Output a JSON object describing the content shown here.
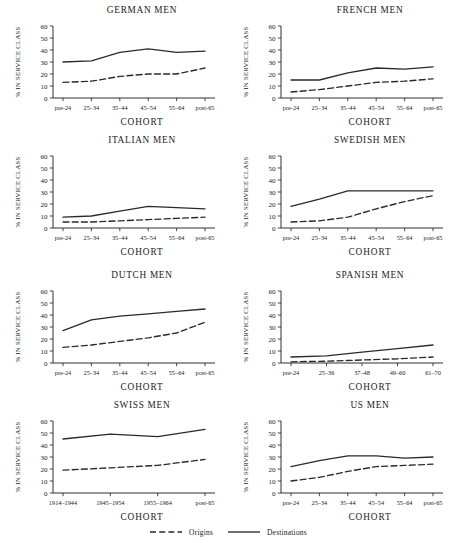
{
  "figure": {
    "ylabel": "% IN SERVICE CLASS",
    "xlabel": "COHORT",
    "yticks": [
      "0",
      "10",
      "20",
      "30",
      "40",
      "50",
      "60"
    ],
    "ylim": [
      0,
      60
    ],
    "legend": {
      "position": "bottom-center",
      "items": [
        {
          "label": "Origins",
          "style": "dashed"
        },
        {
          "label": "Destinations",
          "style": "solid"
        }
      ]
    },
    "line_color": "#2a2a2a"
  },
  "chart_data": [
    {
      "type": "line",
      "title": "GERMAN MEN",
      "xlabel": "COHORT",
      "ylabel": "% IN SERVICE CLASS",
      "ylim": [
        0,
        60
      ],
      "grid": false,
      "categories": [
        "pre-24",
        "25–34",
        "35–44",
        "45–54",
        "55–64",
        "post-65"
      ],
      "series": [
        {
          "name": "Origins",
          "style": "dashed",
          "values": [
            13,
            14,
            18,
            20,
            20,
            25
          ]
        },
        {
          "name": "Destinations",
          "style": "solid",
          "values": [
            30,
            31,
            38,
            41,
            38,
            39
          ]
        }
      ]
    },
    {
      "type": "line",
      "title": "FRENCH MEN",
      "xlabel": "COHORT",
      "ylabel": "% IN SERVICE CLASS",
      "ylim": [
        0,
        60
      ],
      "grid": false,
      "categories": [
        "pre-24",
        "25–34",
        "35–44",
        "45–54",
        "55–64",
        "post-65"
      ],
      "series": [
        {
          "name": "Origins",
          "style": "dashed",
          "values": [
            5,
            7,
            10,
            13,
            14,
            16
          ]
        },
        {
          "name": "Destinations",
          "style": "solid",
          "values": [
            15,
            15,
            21,
            25,
            24,
            26
          ]
        }
      ]
    },
    {
      "type": "line",
      "title": "ITALIAN MEN",
      "xlabel": "COHORT",
      "ylabel": "% IN SERVICE CLASS",
      "ylim": [
        0,
        60
      ],
      "grid": false,
      "categories": [
        "pre-24",
        "25–34",
        "35–44",
        "45–54",
        "55–64",
        "post-65"
      ],
      "series": [
        {
          "name": "Origins",
          "style": "dashed",
          "values": [
            5,
            5,
            6,
            7,
            8,
            9
          ]
        },
        {
          "name": "Destinations",
          "style": "solid",
          "values": [
            9,
            10,
            14,
            18,
            17,
            16
          ]
        }
      ]
    },
    {
      "type": "line",
      "title": "SWEDISH MEN",
      "xlabel": "COHORT",
      "ylabel": "% IN SERVICE CLASS",
      "ylim": [
        0,
        60
      ],
      "grid": false,
      "categories": [
        "pre-24",
        "25–34",
        "35–44",
        "45–54",
        "55–64",
        "post-65"
      ],
      "series": [
        {
          "name": "Origins",
          "style": "dashed",
          "values": [
            5,
            6,
            9,
            16,
            22,
            27
          ]
        },
        {
          "name": "Destinations",
          "style": "solid",
          "values": [
            18,
            24,
            31,
            31,
            31,
            31
          ]
        }
      ]
    },
    {
      "type": "line",
      "title": "DUTCH MEN",
      "xlabel": "COHORT",
      "ylabel": "% IN SERVICE CLASS",
      "ylim": [
        0,
        60
      ],
      "grid": false,
      "categories": [
        "pre-24",
        "25–34",
        "35–44",
        "45–54",
        "55–64",
        "post-65"
      ],
      "series": [
        {
          "name": "Origins",
          "style": "dashed",
          "values": [
            13,
            15,
            18,
            21,
            25,
            34
          ]
        },
        {
          "name": "Destinations",
          "style": "solid",
          "values": [
            27,
            36,
            39,
            41,
            43,
            45
          ]
        }
      ]
    },
    {
      "type": "line",
      "title": "SPANISH MEN",
      "xlabel": "COHORT",
      "ylabel": "% IN SERVICE CLASS",
      "ylim": [
        0,
        60
      ],
      "grid": false,
      "categories": [
        "pre-24",
        "25–36",
        "37–48",
        "49–60",
        "61–70"
      ],
      "series": [
        {
          "name": "Origins",
          "style": "dashed",
          "values": [
            1,
            1.5,
            2.5,
            3.5,
            5
          ]
        },
        {
          "name": "Destinations",
          "style": "solid",
          "values": [
            5,
            6,
            9,
            12,
            15
          ]
        }
      ]
    },
    {
      "type": "line",
      "title": "SWISS MEN",
      "xlabel": "COHORT",
      "ylabel": "% IN SERVICE CLASS",
      "ylim": [
        0,
        60
      ],
      "grid": false,
      "categories": [
        "1914–1944",
        "1945–1954",
        "1955–1964",
        "post-65"
      ],
      "series": [
        {
          "name": "Origins",
          "style": "dashed",
          "values": [
            19,
            21,
            23,
            28
          ]
        },
        {
          "name": "Destinations",
          "style": "solid",
          "values": [
            45,
            49,
            47,
            53
          ]
        }
      ]
    },
    {
      "type": "line",
      "title": "US MEN",
      "xlabel": "COHORT",
      "ylabel": "% IN SERVICE CLASS",
      "ylim": [
        0,
        60
      ],
      "grid": false,
      "categories": [
        "pre-24",
        "25–34",
        "35–44",
        "45–54",
        "55–64",
        "post-65"
      ],
      "series": [
        {
          "name": "Origins",
          "style": "dashed",
          "values": [
            10,
            13,
            18,
            22,
            23,
            24
          ]
        },
        {
          "name": "Destinations",
          "style": "solid",
          "values": [
            22,
            27,
            31,
            31,
            29,
            30
          ]
        }
      ]
    }
  ]
}
